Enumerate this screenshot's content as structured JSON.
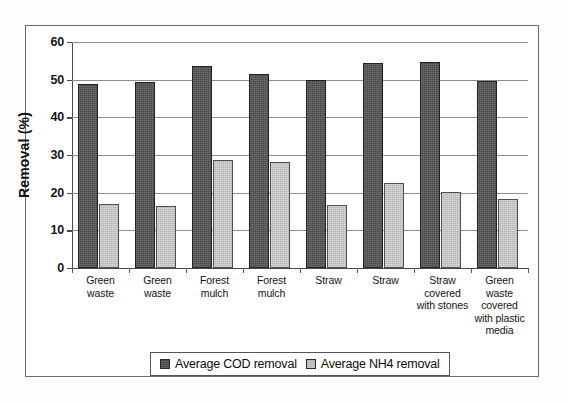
{
  "chart_data": {
    "type": "bar",
    "title": "",
    "xlabel": "",
    "ylabel": "Removal (%)",
    "ylim": [
      0,
      60
    ],
    "yticks": [
      0,
      10,
      20,
      30,
      40,
      50,
      60
    ],
    "ytick_labels": [
      "0",
      "10",
      "20",
      "30",
      "40",
      "50",
      "60"
    ],
    "grid": "horizontal",
    "legend_position": "bottom",
    "categories": [
      "Green waste",
      "Green waste",
      "Forest mulch",
      "Forest mulch",
      "Straw",
      "Straw",
      "Straw covered with stones",
      "Green waste covered with plastic media"
    ],
    "category_lines": [
      [
        "Green",
        "waste"
      ],
      [
        "Green",
        "waste"
      ],
      [
        "Forest",
        "mulch"
      ],
      [
        "Forest",
        "mulch"
      ],
      [
        "Straw"
      ],
      [
        "Straw"
      ],
      [
        "Straw",
        "covered",
        "with stones"
      ],
      [
        "Green",
        "waste",
        "covered",
        "with plastic",
        "media"
      ]
    ],
    "series": [
      {
        "name": "Average COD removal",
        "color": "#4a4a4a",
        "values": [
          48.8,
          49.3,
          53.6,
          51.6,
          50.0,
          54.4,
          54.6,
          49.6
        ]
      },
      {
        "name": "Average NH4 removal",
        "color": "#b4b4b4",
        "values": [
          17.1,
          16.5,
          28.7,
          28.2,
          16.7,
          22.7,
          20.2,
          18.4
        ]
      }
    ]
  },
  "legend": {
    "items": [
      {
        "label": "Average COD removal",
        "swatch": "cod"
      },
      {
        "label": "Average NH4 removal",
        "swatch": "nh4"
      }
    ]
  }
}
